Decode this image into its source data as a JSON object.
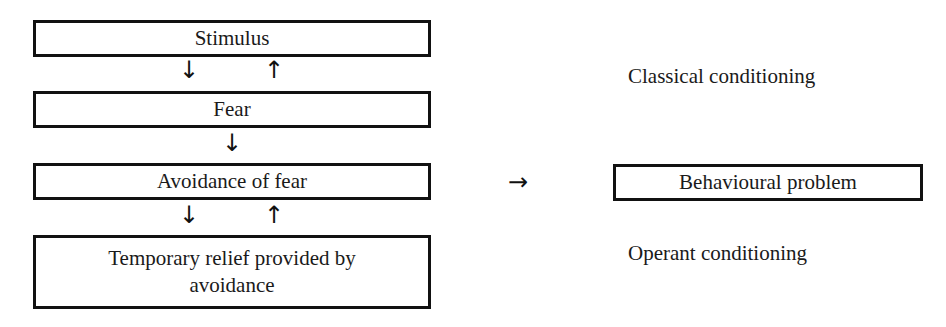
{
  "diagram": {
    "left_column": [
      {
        "id": "stimulus",
        "label": "Stimulus"
      },
      {
        "id": "fear",
        "label": "Fear"
      },
      {
        "id": "avoidance",
        "label": "Avoidance of fear"
      },
      {
        "id": "relief",
        "label": "Temporary relief provided by avoidance"
      }
    ],
    "arrows": {
      "down": "↓",
      "up": "↑",
      "right": "→"
    },
    "annotations": {
      "classical": "Classical conditioning",
      "operant": "Operant conditioning"
    },
    "result": {
      "label": "Behavioural problem"
    }
  }
}
